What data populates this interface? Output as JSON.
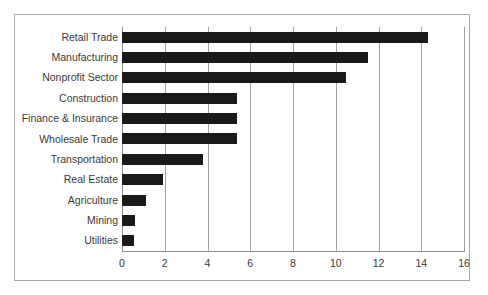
{
  "chart_data": {
    "type": "bar",
    "orientation": "horizontal",
    "title": "",
    "subtitle": "",
    "xlabel": "",
    "ylabel": "",
    "categories": [
      "Retail Trade",
      "Manufacturing",
      "Nonprofit Sector",
      "Construction",
      "Finance & Insurance",
      "Wholesale Trade",
      "Transportation",
      "Real Estate",
      "Agriculture",
      "Mining",
      "Utilities"
    ],
    "values": [
      14.3,
      11.5,
      10.5,
      5.4,
      5.4,
      5.4,
      3.8,
      1.9,
      1.1,
      0.6,
      0.55
    ],
    "xlim": [
      0,
      16
    ],
    "xticks": [
      0,
      2,
      4,
      6,
      8,
      10,
      12,
      14,
      16
    ],
    "xtick_labels": [
      "0",
      "2",
      "4",
      "6",
      "8",
      "10",
      "12",
      "14",
      "16"
    ],
    "grid": true,
    "grid_axis": "x",
    "legend": false,
    "legend_position": "none",
    "series": [
      {
        "name": "",
        "values": [
          14.3,
          11.5,
          10.5,
          5.4,
          5.4,
          5.4,
          3.8,
          1.9,
          1.1,
          0.6,
          0.55
        ]
      }
    ]
  },
  "style": {
    "bar_color": "#1a1a1a",
    "gridline_color": "#a0a0a0",
    "axis_color": "#8e8e8e",
    "frame_color": "#a8a8a8",
    "text_color": "#3a3a3a",
    "background": "#ffffff"
  }
}
